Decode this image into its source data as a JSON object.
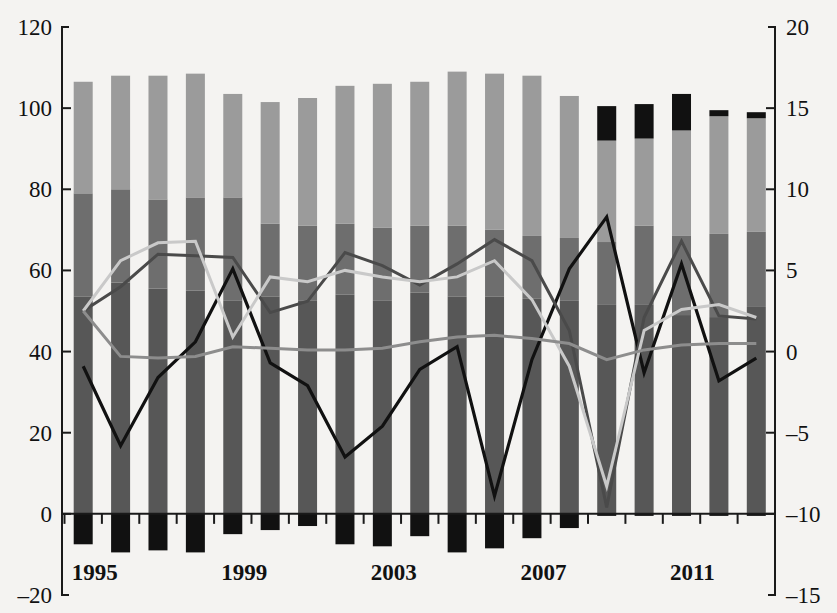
{
  "chart_data": {
    "type": "bar",
    "title": "",
    "subtitle": "",
    "xlabel": "",
    "ylabel": "",
    "y2label": "",
    "grid": false,
    "legend": "none",
    "ylim": [
      -20,
      120
    ],
    "y2lim": [
      -15,
      20
    ],
    "yticks": [
      -20,
      0,
      20,
      40,
      60,
      80,
      100,
      120
    ],
    "y2ticks": [
      -15,
      -10,
      -5,
      0,
      5,
      10,
      15,
      20
    ],
    "categories": [
      1995,
      1996,
      1997,
      1998,
      1999,
      2000,
      2001,
      2002,
      2003,
      2004,
      2005,
      2006,
      2007,
      2008,
      2009,
      2010,
      2011,
      2012,
      2013
    ],
    "xtick_labels": [
      "1995",
      "1999",
      "2003",
      "2007",
      "2011"
    ],
    "xtick_label_categories": [
      1995,
      1999,
      2003,
      2007,
      2011
    ],
    "stacked_series": [
      {
        "name": "segment-1-dark-gray",
        "color": "#575757",
        "values": [
          53.5,
          57.0,
          55.5,
          55.0,
          52.5,
          53.5,
          52.5,
          54.0,
          52.5,
          54.5,
          53.5,
          53.5,
          53.0,
          52.5,
          51.5,
          51.5,
          49.0,
          48.5,
          51.0
        ]
      },
      {
        "name": "segment-2-medium-gray",
        "color": "#6e6e6e",
        "values": [
          25.5,
          23.0,
          22.0,
          23.0,
          25.5,
          18.0,
          18.5,
          17.5,
          18.0,
          16.5,
          17.5,
          16.5,
          15.5,
          15.5,
          15.5,
          19.5,
          19.5,
          20.5,
          18.5
        ]
      },
      {
        "name": "segment-3-light-gray",
        "color": "#9b9b9b",
        "values": [
          27.5,
          28.0,
          30.5,
          30.5,
          25.5,
          30.0,
          31.5,
          34.0,
          35.5,
          35.5,
          38.0,
          38.5,
          39.5,
          35.0,
          25.0,
          21.5,
          26.0,
          29.0,
          28.0
        ]
      },
      {
        "name": "segment-4-black-top",
        "color": "#111111",
        "values": [
          0,
          0,
          0,
          0,
          0,
          0,
          0,
          0,
          0,
          0,
          0,
          0,
          0,
          0,
          8.5,
          8.5,
          9.0,
          1.5,
          1.5
        ]
      }
    ],
    "negative_series": {
      "name": "segment-negative-black",
      "color": "#111111",
      "values": [
        -7.5,
        -9.5,
        -9.0,
        -9.5,
        -5.0,
        -4.0,
        -3.0,
        -7.5,
        -8.0,
        -5.5,
        -9.5,
        -8.5,
        -6.0,
        -3.5,
        -0.5,
        -0.5,
        -0.5,
        -0.5,
        -0.5
      ]
    },
    "line_series": [
      {
        "name": "black-line",
        "color": "#111111",
        "width": 3.2,
        "axis": "right",
        "values": [
          -0.9,
          -5.8,
          -1.6,
          0.6,
          5.1,
          -0.7,
          -2.1,
          -6.5,
          -4.6,
          -1.1,
          0.3,
          -8.9,
          -0.5,
          5.1,
          8.3,
          -1.3,
          5.4,
          -1.8,
          -0.4
        ]
      },
      {
        "name": "dark-gray-line",
        "color": "#4a4a4a",
        "width": 3.0,
        "axis": "right",
        "values": [
          2.5,
          4.0,
          6.0,
          5.9,
          5.8,
          2.4,
          3.1,
          6.1,
          5.3,
          4.1,
          5.4,
          6.9,
          5.6,
          1.3,
          -9.6,
          2.1,
          6.8,
          2.2,
          2.0
        ]
      },
      {
        "name": "light-gray-line",
        "color": "#c9c9c9",
        "width": 3.0,
        "axis": "right",
        "values": [
          2.5,
          5.6,
          6.7,
          6.8,
          0.9,
          4.6,
          4.3,
          5.0,
          4.6,
          4.3,
          4.6,
          5.6,
          3.2,
          -0.9,
          -8.3,
          1.3,
          2.6,
          2.9,
          2.1
        ]
      },
      {
        "name": "medium-gray-line",
        "color": "#8d8d8d",
        "width": 3.0,
        "axis": "right",
        "values": [
          2.5,
          -0.3,
          -0.4,
          -0.3,
          0.3,
          0.2,
          0.1,
          0.1,
          0.2,
          0.6,
          0.9,
          1.0,
          0.8,
          0.5,
          -0.5,
          0.1,
          0.4,
          0.5,
          0.5
        ]
      }
    ]
  },
  "axes": {
    "left_axis_name": "left-value-axis",
    "right_axis_name": "right-value-axis",
    "bottom_axis_name": "category-axis"
  },
  "colors": {
    "background": "#f4f3f1",
    "axis": "#1a1a1a",
    "segment_dark_gray": "#575757",
    "segment_medium_gray": "#6e6e6e",
    "segment_light_gray": "#9b9b9b",
    "segment_black": "#111111"
  }
}
